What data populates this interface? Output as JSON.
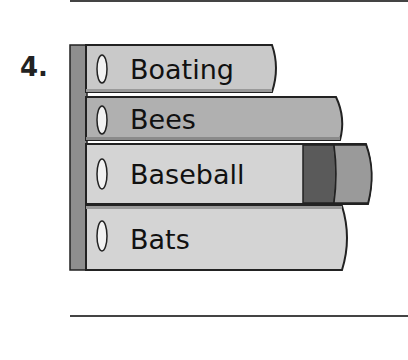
{
  "question": {
    "number": "4.",
    "books": [
      {
        "title": "Boating",
        "color": "#c9c9c9"
      },
      {
        "title": "Bees",
        "color": "#b0b0b0"
      },
      {
        "title": "Baseball",
        "color": "#d4d4d4",
        "band_color": "#5a5a5a",
        "tab_color": "#9a9a9a"
      },
      {
        "title": "Bats",
        "color": "#d4d4d4"
      }
    ],
    "shelf_color": "#8e8e8e"
  }
}
